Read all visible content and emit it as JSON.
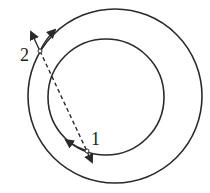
{
  "diagram": {
    "colors": {
      "stroke": "#2a2a2a",
      "background": "#ffffff"
    },
    "outer_circle": {
      "cx": 115,
      "cy": 96,
      "r": 87
    },
    "inner_circle": {
      "cx": 106,
      "cy": 97,
      "r": 58
    },
    "points": [
      {
        "id": "1",
        "label": "1",
        "x": 87,
        "y": 151,
        "label_x": 94,
        "label_y": 144
      },
      {
        "id": "2",
        "label": "2",
        "x": 40,
        "y": 51,
        "label_x": 19,
        "label_y": 60
      }
    ],
    "dashed_line": {
      "from": "point-2-extended",
      "to": "point-1-extended"
    }
  }
}
